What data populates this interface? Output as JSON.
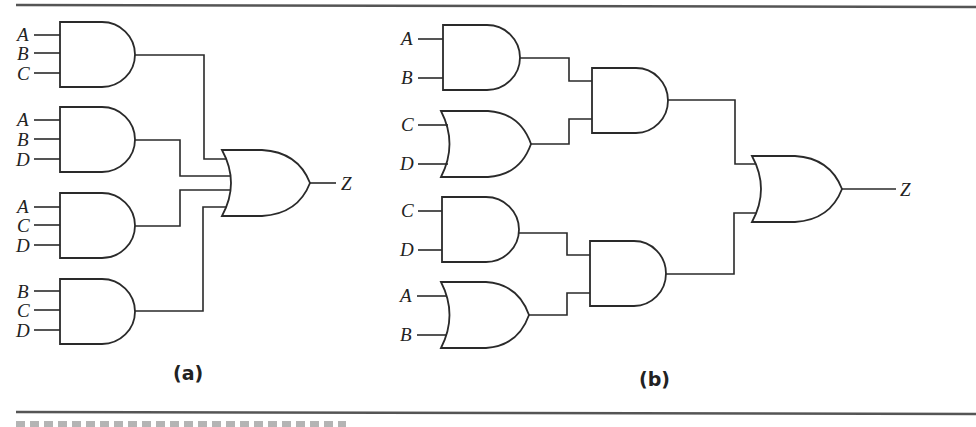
{
  "figure": {
    "panel_a": {
      "caption": "(a)",
      "and_gates": [
        {
          "inputs": [
            "A",
            "B",
            "C"
          ]
        },
        {
          "inputs": [
            "A",
            "B",
            "D"
          ]
        },
        {
          "inputs": [
            "A",
            "C",
            "D"
          ]
        },
        {
          "inputs": [
            "B",
            "C",
            "D"
          ]
        }
      ],
      "or_gate": {
        "inputs": 4
      },
      "output_label": "Z"
    },
    "panel_b": {
      "caption": "(b)",
      "first_level": [
        {
          "type": "AND",
          "inputs": [
            "A",
            "B"
          ]
        },
        {
          "type": "OR",
          "inputs": [
            "C",
            "D"
          ]
        },
        {
          "type": "AND",
          "inputs": [
            "C",
            "D"
          ]
        },
        {
          "type": "OR",
          "inputs": [
            "A",
            "B"
          ]
        }
      ],
      "second_level": [
        {
          "type": "AND"
        },
        {
          "type": "AND"
        }
      ],
      "final_gate": {
        "type": "OR"
      },
      "output_label": "Z"
    }
  },
  "colors": {
    "line": "#2a2a2a",
    "rule": "#555555",
    "background": "#ffffff"
  }
}
